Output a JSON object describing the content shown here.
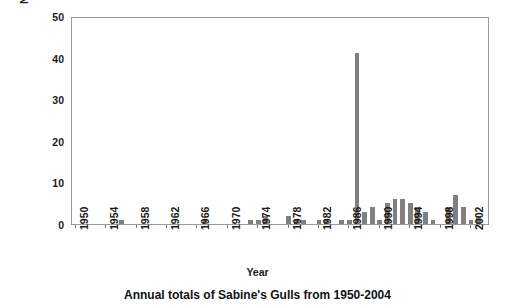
{
  "chart_data": {
    "type": "bar",
    "title": "",
    "caption": "Annual totals of Sabine's Gulls from 1950-2004",
    "xlabel": "Year",
    "ylabel": "Number of individuals",
    "ylim": [
      0,
      50
    ],
    "yticks": [
      0,
      10,
      20,
      30,
      40,
      50
    ],
    "xlim": [
      1950,
      2004
    ],
    "xticks": [
      1950,
      1954,
      1958,
      1962,
      1966,
      1970,
      1974,
      1978,
      1982,
      1986,
      1990,
      1994,
      1998,
      2002
    ],
    "grid": false,
    "legend": null,
    "bar_color": "#808080",
    "categories": [
      1950,
      1951,
      1952,
      1953,
      1954,
      1955,
      1956,
      1957,
      1958,
      1959,
      1960,
      1961,
      1962,
      1963,
      1964,
      1965,
      1966,
      1967,
      1968,
      1969,
      1970,
      1971,
      1972,
      1973,
      1974,
      1975,
      1976,
      1977,
      1978,
      1979,
      1980,
      1981,
      1982,
      1983,
      1984,
      1985,
      1986,
      1987,
      1988,
      1989,
      1990,
      1991,
      1992,
      1993,
      1994,
      1995,
      1996,
      1997,
      1998,
      1999,
      2000,
      2001,
      2002,
      2003,
      2004
    ],
    "values": [
      0,
      0,
      0,
      0,
      0,
      0,
      1,
      0,
      0,
      0,
      0,
      0,
      0,
      0,
      0,
      0,
      0,
      1,
      0,
      0,
      0,
      0,
      0,
      1,
      1,
      2,
      0,
      0,
      2,
      1,
      1,
      0,
      1,
      1,
      0,
      1,
      1,
      41,
      3,
      4,
      1,
      5,
      6,
      6,
      5,
      4,
      3,
      1,
      0,
      4,
      7,
      4,
      1,
      2,
      0
    ]
  },
  "axis": {
    "ylabel": "Number of individuals",
    "xlabel": "Year"
  }
}
